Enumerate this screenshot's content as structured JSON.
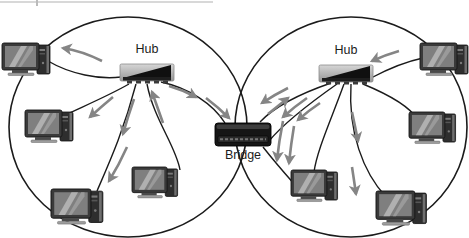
{
  "diagram": {
    "type": "network-topology",
    "labels": {
      "left_hub": "Hub",
      "right_hub": "Hub",
      "bridge": "Bridge"
    },
    "networks": [
      {
        "id": "left-ring",
        "hub_label": "Hub",
        "computer_count": 4
      },
      {
        "id": "right-ring",
        "hub_label": "Hub",
        "computer_count": 4
      }
    ],
    "bridge": {
      "label": "Bridge"
    },
    "colors": {
      "background": "#ffffff",
      "cable": "#1b1b1b",
      "ring": "#1b1b1b",
      "arrow": "#858585",
      "hub_body_light": "#d2d2d2",
      "hub_body_dark": "#989898",
      "bridge_body": "#161616",
      "label_text": "#1c1c1c"
    }
  }
}
